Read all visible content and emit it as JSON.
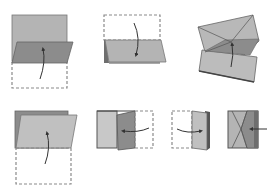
{
  "diagram": {
    "type": "folding-instructions",
    "steps": [
      {
        "id": 1,
        "description": "Fold bottom half up over the top half",
        "arrow": "upward curved"
      },
      {
        "id": 2,
        "description": "Fold top half down",
        "arrow": "downward curved"
      },
      {
        "id": 3,
        "description": "Fold into envelope shape with center crease",
        "arrow": "upward"
      },
      {
        "id": 4,
        "description": "Fold bottom half up",
        "arrow": "upward curved"
      },
      {
        "id": 5,
        "description": "Fold right flap to the left",
        "arrow": "leftward"
      },
      {
        "id": 6,
        "description": "Fold left side over to the right",
        "arrow": "rightward"
      },
      {
        "id": 7,
        "description": "Push in from the right side",
        "arrow": "leftward"
      }
    ],
    "colors": {
      "background": "#ffffff",
      "paper_light": "#c8c8c8",
      "paper_mid": "#b4b4b4",
      "paper_dark": "#8c8c8c",
      "edge": "#555555",
      "dashed_outline": "#8a8a8a",
      "arrow": "#333333"
    }
  }
}
